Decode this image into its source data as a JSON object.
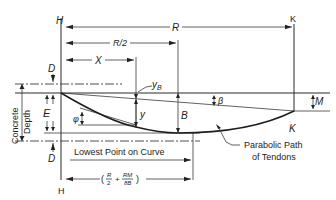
{
  "diagram": {
    "labels": {
      "h_top": "H",
      "h_bottom": "H",
      "k_top": "K",
      "k_bottom": "K",
      "r": "R",
      "r_half": "R/2",
      "r_half_num": "R",
      "r_half_den": "2",
      "x": "X",
      "d_top": "D",
      "d_bottom": "D",
      "e": "E",
      "y_b": "y",
      "y_b_sub": "B",
      "y": "y",
      "b": "B",
      "beta": "β",
      "phi": "φ",
      "m": "M",
      "concrete_depth_1": "Concrete",
      "concrete_depth_2": "Depth",
      "lowest_point": "Lowest Point on Curve",
      "parabolic_1": "Parabolic Path",
      "parabolic_2": "of Tendons",
      "formula_open": "(",
      "formula_r": "R",
      "formula_2": "2",
      "formula_plus": "+",
      "formula_rm": "RM",
      "formula_8b": "8B",
      "formula_close": ")"
    }
  }
}
